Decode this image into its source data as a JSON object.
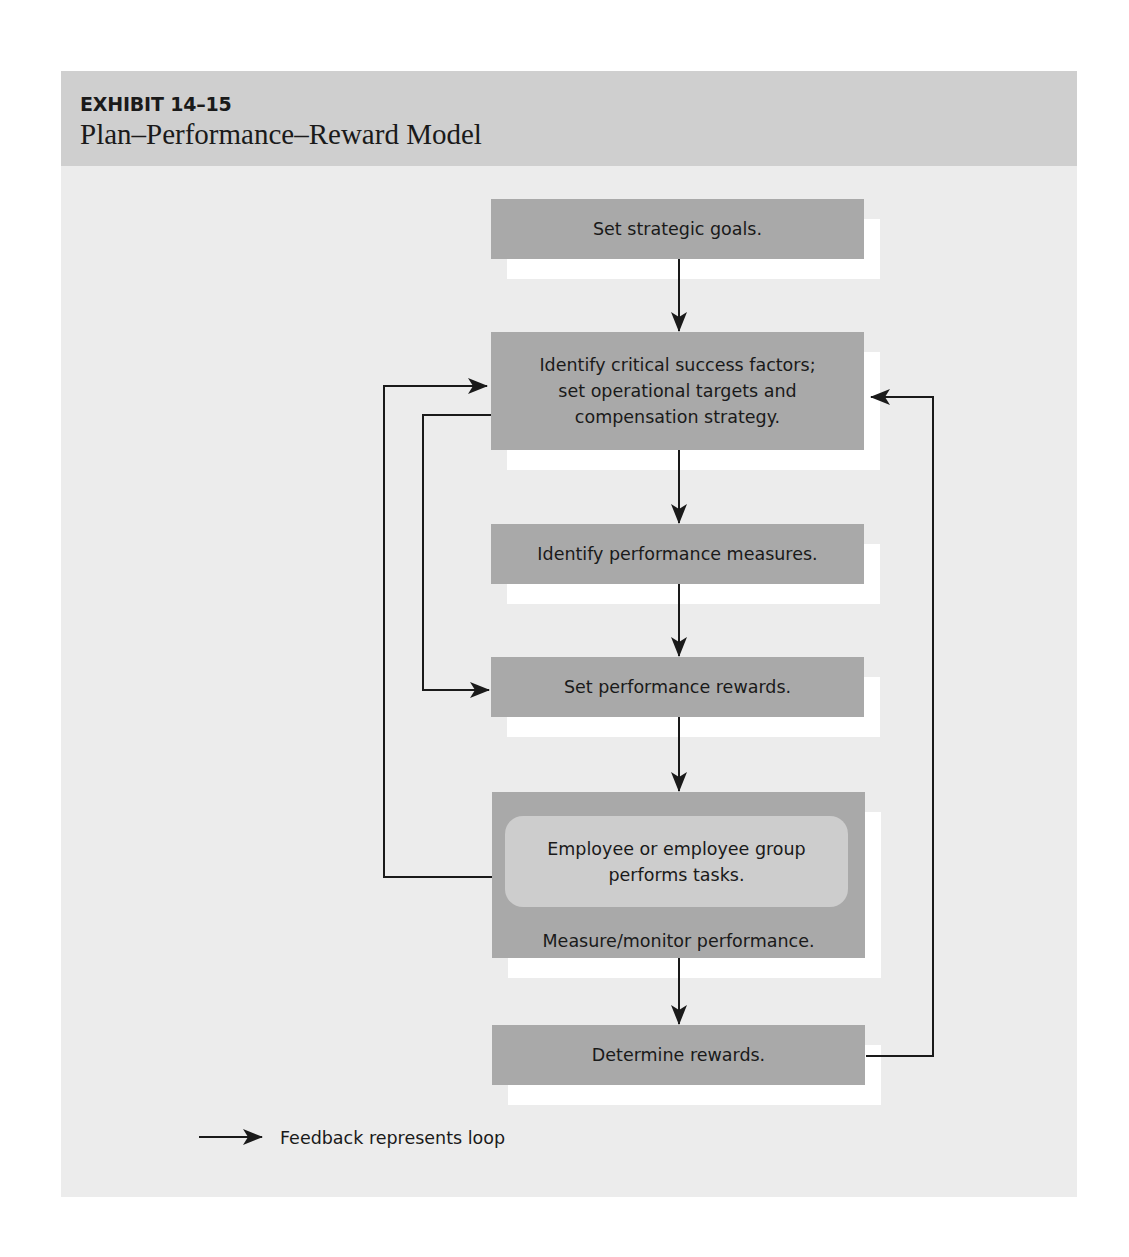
{
  "exhibit": {
    "number": "EXHIBIT 14–15",
    "title": "Plan–Performance–Reward Model"
  },
  "flow": {
    "steps": [
      {
        "id": "set-strategic-goals",
        "text": "Set strategic goals."
      },
      {
        "id": "identify-critical-success-factors",
        "lines": [
          "Identify critical success factors;",
          "set operational targets and",
          "compensation strategy."
        ]
      },
      {
        "id": "identify-performance-measures",
        "text": "Identify performance measures."
      },
      {
        "id": "set-performance-rewards",
        "text": "Set performance rewards."
      },
      {
        "id": "measure-monitor-performance",
        "inner_lines": [
          "Employee or employee group",
          "performs tasks."
        ],
        "text": "Measure/monitor performance."
      },
      {
        "id": "determine-rewards",
        "text": "Determine rewards."
      }
    ],
    "edges": [
      {
        "from": "set-strategic-goals",
        "to": "identify-critical-success-factors",
        "type": "sequence"
      },
      {
        "from": "identify-critical-success-factors",
        "to": "identify-performance-measures",
        "type": "sequence"
      },
      {
        "from": "identify-performance-measures",
        "to": "set-performance-rewards",
        "type": "sequence"
      },
      {
        "from": "set-performance-rewards",
        "to": "measure-monitor-performance",
        "type": "sequence"
      },
      {
        "from": "measure-monitor-performance",
        "to": "determine-rewards",
        "type": "sequence"
      },
      {
        "from": "identify-critical-success-factors",
        "to": "set-performance-rewards",
        "type": "feedback-left-inner"
      },
      {
        "from": "measure-monitor-performance",
        "to": "identify-critical-success-factors",
        "type": "feedback-left-outer"
      },
      {
        "from": "determine-rewards",
        "to": "identify-critical-success-factors",
        "type": "feedback-right"
      }
    ]
  },
  "legend": {
    "text": "Feedback represents loop"
  },
  "colors": {
    "panel_bg": "#ececec",
    "header_bg": "#cfcfcf",
    "box_fill": "#a9a9a9",
    "inner_box_fill": "#cdcdcd",
    "shadow": "#ffffff",
    "line": "#1a1a1a"
  }
}
